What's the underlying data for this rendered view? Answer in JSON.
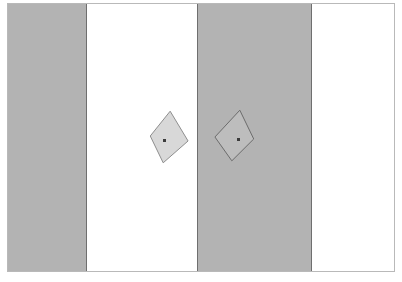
{
  "figure": {
    "title": "",
    "frame": {
      "border_color": "#b9b9b9",
      "background_color": "#fdfdfd",
      "x": 7,
      "y": 3,
      "width": 388,
      "height": 269
    },
    "bands": [
      {
        "name": "band-gray-left",
        "tone": "gray",
        "color": "#b3b3b3",
        "x": 0,
        "width": 78
      },
      {
        "name": "band-white-left",
        "tone": "white",
        "color": "#ffffff",
        "x": 79,
        "width": 110
      },
      {
        "name": "band-gray-right",
        "tone": "gray",
        "color": "#b3b3b3",
        "x": 190,
        "width": 113
      },
      {
        "name": "band-white-right",
        "tone": "white",
        "color": "#ffffff",
        "x": 304,
        "width": 84
      }
    ],
    "dividers": [
      {
        "name": "divider-1",
        "x": 78,
        "color": "#6f6f6f"
      },
      {
        "name": "divider-2",
        "x": 189,
        "color": "#6f6f6f"
      },
      {
        "name": "divider-3",
        "x": 303,
        "color": "#6f6f6f"
      }
    ],
    "shapes": [
      {
        "name": "kite-left",
        "label": "kite-on-white",
        "fill": "#d8d8d8",
        "stroke": "#8d8d8d",
        "stroke_width": 1,
        "points": "163,108 181,138 156,160 143,133",
        "center_dot": {
          "x": 155,
          "y": 135,
          "color": "#3b3b3b"
        }
      },
      {
        "name": "kite-right",
        "label": "kite-on-gray",
        "fill": "#bdbdbd",
        "stroke": "#6b6b6b",
        "stroke_width": 1,
        "points": "233,107 247,136 225,158 208,134",
        "center_dot": {
          "x": 229,
          "y": 134,
          "color": "#3b3b3b"
        }
      }
    ]
  }
}
